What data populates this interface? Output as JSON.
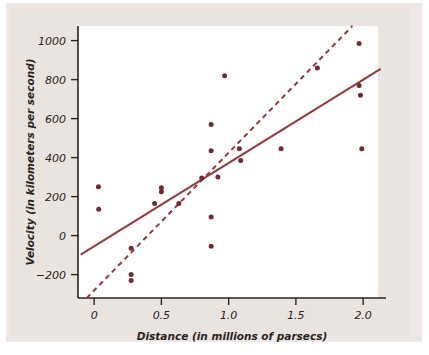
{
  "figure": {
    "background_color": "#eae4e1",
    "plot_background_color": "#ffffff",
    "point_color": "#6e2a33",
    "line_color": "#8f3a3f",
    "axis_color": "#2b2320"
  },
  "chart_data": {
    "type": "scatter",
    "title": "",
    "xlabel": "Distance (in millions of parsecs)",
    "ylabel": "Velocity (in kilometers per second)",
    "xlim": [
      -0.12,
      2.17
    ],
    "ylim": [
      -320,
      1075
    ],
    "xticks": [
      0,
      0.5,
      1.0,
      1.5,
      2.0
    ],
    "xtick_labels": [
      "0",
      "0.5",
      "1.0",
      "1.5",
      "2.0"
    ],
    "yticks": [
      -200,
      0,
      200,
      400,
      600,
      800,
      1000
    ],
    "ytick_labels": [
      "-200",
      "0",
      "200",
      "400",
      "600",
      "800",
      "1000"
    ],
    "grid": false,
    "legend": false,
    "points": [
      {
        "x": 0.032,
        "y": 250
      },
      {
        "x": 0.034,
        "y": 135
      },
      {
        "x": 0.275,
        "y": -65
      },
      {
        "x": 0.275,
        "y": -200
      },
      {
        "x": 0.275,
        "y": -230
      },
      {
        "x": 0.45,
        "y": 165
      },
      {
        "x": 0.5,
        "y": 245
      },
      {
        "x": 0.5,
        "y": 225
      },
      {
        "x": 0.63,
        "y": 165
      },
      {
        "x": 0.8,
        "y": 295
      },
      {
        "x": 0.87,
        "y": 570
      },
      {
        "x": 0.87,
        "y": 435
      },
      {
        "x": 0.87,
        "y": 95
      },
      {
        "x": 0.87,
        "y": -55
      },
      {
        "x": 0.92,
        "y": 300
      },
      {
        "x": 0.97,
        "y": 820
      },
      {
        "x": 1.08,
        "y": 445
      },
      {
        "x": 1.09,
        "y": 385
      },
      {
        "x": 1.39,
        "y": 445
      },
      {
        "x": 1.66,
        "y": 860
      },
      {
        "x": 1.97,
        "y": 985
      },
      {
        "x": 1.97,
        "y": 770
      },
      {
        "x": 1.98,
        "y": 720
      },
      {
        "x": 1.99,
        "y": 445
      }
    ],
    "series": [
      {
        "name": "solid-fit-line",
        "style": "solid",
        "x": [
          -0.1,
          2.13
        ],
        "y": [
          -98,
          855
        ]
      },
      {
        "name": "dashed-fit-line",
        "style": "dashed",
        "x": [
          -0.055,
          1.92
        ],
        "y": [
          -320,
          1075
        ]
      }
    ]
  }
}
